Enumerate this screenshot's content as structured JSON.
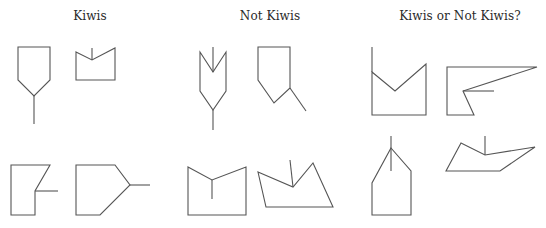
{
  "columns": [
    {
      "title": "Kiwis",
      "center_x": 90,
      "shapes": [
        {
          "name": "kiwi-shape-1",
          "polygon": "18,47 50,47 50,80 34,96 18,80",
          "lines": [
            [
              34,
              96,
              34,
              124
            ]
          ]
        },
        {
          "name": "kiwi-shape-2",
          "polygon": "76,52 92,60 115,48 115,80 76,80",
          "lines": [
            [
              92,
              60,
              92,
              48
            ]
          ]
        },
        {
          "name": "kiwi-shape-3",
          "polygon": "11,165 50,165 35,191 35,215 11,215",
          "lines": [
            [
              35,
              191,
              58,
              191
            ]
          ]
        },
        {
          "name": "kiwi-shape-4",
          "polygon": "76,165 115,165 130,185 100,215 76,215",
          "lines": [
            [
              130,
              185,
              150,
              185
            ]
          ]
        }
      ]
    },
    {
      "title": "Not Kiwis",
      "center_x": 270,
      "shapes": [
        {
          "name": "not-kiwi-shape-1",
          "polygon": "200,52 213,72 226,52 226,91 213,110 200,91",
          "lines": [
            [
              213,
              72,
              213,
              47
            ],
            [
              213,
              110,
              213,
              130
            ]
          ]
        },
        {
          "name": "not-kiwi-shape-2",
          "polygon": "258,47 290,47 290,88 274,103 258,80",
          "lines": [
            [
              290,
              88,
              306,
              111
            ]
          ]
        },
        {
          "name": "not-kiwi-shape-3",
          "polygon": "188,167 212,180 246,167 246,215 188,215",
          "lines": [
            [
              212,
              180,
              212,
              199
            ]
          ]
        },
        {
          "name": "not-kiwi-shape-4",
          "polygon": "258,172 293,187 313,163 333,207 266,207",
          "lines": [
            [
              293,
              187,
              290,
              160
            ]
          ]
        }
      ]
    },
    {
      "title": "Kiwis or Not Kiwis?",
      "center_x": 460,
      "shapes": [
        {
          "name": "unknown-shape-1",
          "polygon": "372,72 395,91 426,64 426,115 372,115",
          "lines": [
            [
              372,
              47,
              372,
              72
            ]
          ]
        },
        {
          "name": "unknown-shape-2",
          "polygon": "447,67 537,67 463,91 474,115 447,115",
          "lines": [
            [
              463,
              91,
              494,
              91
            ]
          ]
        },
        {
          "name": "unknown-shape-3",
          "polygon": "391,148 411,171 411,215 372,215 372,183",
          "lines": [
            [
              391,
              136,
              391,
              171
            ]
          ]
        },
        {
          "name": "unknown-shape-4",
          "polygon": "461,143 485,155 535,147 500,171 446,171",
          "lines": [
            [
              485,
              155,
              485,
              136
            ]
          ]
        }
      ]
    }
  ],
  "colors": {
    "stroke": "#555555",
    "text": "#2a2a2a",
    "background": "#ffffff"
  }
}
